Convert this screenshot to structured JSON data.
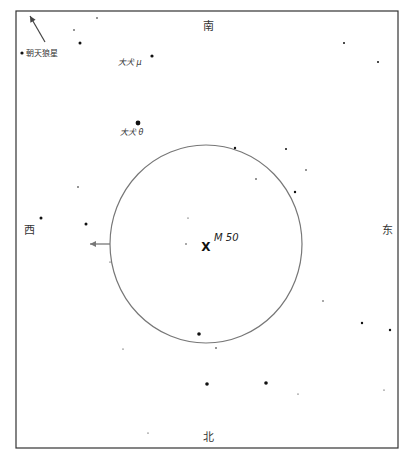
{
  "map": {
    "frame": {
      "left": 16,
      "top": 11,
      "right": 398,
      "bottom": 448,
      "color": "#333333"
    },
    "directions": {
      "north": {
        "label": "北",
        "x": 208,
        "y": 436
      },
      "south": {
        "label": "南",
        "x": 208,
        "y": 25
      },
      "east": {
        "label": "东",
        "x": 387,
        "y": 229
      },
      "west": {
        "label": "西",
        "x": 29,
        "y": 229
      }
    },
    "target": {
      "name": "M 50",
      "marker": "X",
      "x": 206,
      "y": 246
    },
    "field_of_view": {
      "cx": 206,
      "cy": 244,
      "rx": 96,
      "ry": 99,
      "color": "#777777"
    },
    "direction_arrow": {
      "x1": 110,
      "y1": 244,
      "x2": 90,
      "y2": 244,
      "color": "#777777"
    },
    "offscreen_pointer": {
      "label": "朝天狼星",
      "dot": {
        "x": 22,
        "y": 53
      },
      "arrow": {
        "x1": 45,
        "y1": 42,
        "x2": 30,
        "y2": 16
      }
    },
    "labeled_stars": [
      {
        "name": "大犬 μ",
        "x": 152,
        "y": 56,
        "r": 1.6,
        "label_x": 118,
        "label_y": 62
      },
      {
        "name": "大犬 θ",
        "x": 138,
        "y": 123,
        "r": 2.4,
        "label_x": 120,
        "label_y": 132
      }
    ],
    "stars": [
      {
        "x": 97,
        "y": 18,
        "r": 0.8
      },
      {
        "x": 74,
        "y": 30,
        "r": 0.8
      },
      {
        "x": 80,
        "y": 43,
        "r": 1.5
      },
      {
        "x": 344,
        "y": 43,
        "r": 1.0
      },
      {
        "x": 378,
        "y": 62,
        "r": 1.0
      },
      {
        "x": 235,
        "y": 148,
        "r": 1.2
      },
      {
        "x": 286,
        "y": 149,
        "r": 1.0
      },
      {
        "x": 256,
        "y": 179,
        "r": 0.8
      },
      {
        "x": 306,
        "y": 170,
        "r": 0.8
      },
      {
        "x": 295,
        "y": 192,
        "r": 1.2
      },
      {
        "x": 78,
        "y": 187,
        "r": 0.8
      },
      {
        "x": 188,
        "y": 218,
        "r": 0.6
      },
      {
        "x": 41,
        "y": 218,
        "r": 1.5
      },
      {
        "x": 86,
        "y": 224,
        "r": 1.5
      },
      {
        "x": 186,
        "y": 244,
        "r": 0.7
      },
      {
        "x": 110,
        "y": 262,
        "r": 0.6
      },
      {
        "x": 323,
        "y": 301,
        "r": 0.7
      },
      {
        "x": 362,
        "y": 323,
        "r": 1.2
      },
      {
        "x": 390,
        "y": 330,
        "r": 1.2
      },
      {
        "x": 199,
        "y": 334,
        "r": 1.8
      },
      {
        "x": 216,
        "y": 348,
        "r": 0.8
      },
      {
        "x": 123,
        "y": 349,
        "r": 0.6
      },
      {
        "x": 207,
        "y": 384,
        "r": 1.8
      },
      {
        "x": 266,
        "y": 383,
        "r": 1.8
      },
      {
        "x": 298,
        "y": 394,
        "r": 0.6
      },
      {
        "x": 384,
        "y": 390,
        "r": 0.6
      },
      {
        "x": 148,
        "y": 433,
        "r": 0.6
      }
    ]
  }
}
